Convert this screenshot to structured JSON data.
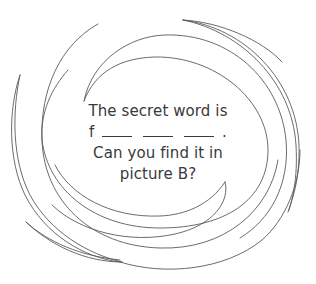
{
  "puzzle": {
    "line1": "The secret word is",
    "line2_prefix": "f",
    "line2_blanks": 3,
    "line2_suffix": ".",
    "line3": "Can you find it in",
    "line4": "picture B?"
  },
  "decoration": {
    "type": "spiral-swirl",
    "stroke_color": "#5a5a5a",
    "background": "#ffffff"
  }
}
